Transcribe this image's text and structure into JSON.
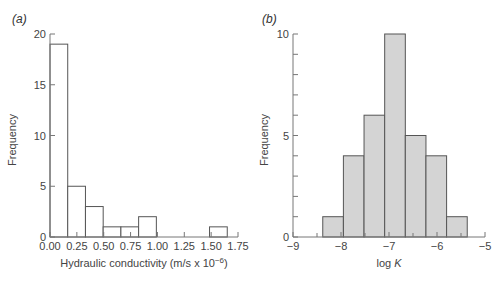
{
  "chart_data": [
    {
      "panel": "(a)",
      "panel_letter": "a",
      "type": "bar",
      "subtype": "histogram",
      "title": "",
      "xlabel": "Hydraulic conductivity (m/s x 10",
      "xlabel_exponent": "−6",
      "xlabel_suffix": ")",
      "ylabel": "Frequency",
      "xlim": [
        0,
        1.75
      ],
      "ylim": [
        0,
        20
      ],
      "x_ticks": [
        0.0,
        0.25,
        0.5,
        0.75,
        1.0,
        1.25,
        1.5,
        1.75
      ],
      "x_tick_labels": [
        "0.00",
        "0.25",
        "0.50",
        "0.75",
        "1.00",
        "1.25",
        "1.50",
        "1.75"
      ],
      "y_ticks": [
        0,
        5,
        10,
        15,
        20
      ],
      "y_tick_labels": [
        "0",
        "5",
        "10",
        "15",
        "20"
      ],
      "bin_edges": [
        0.0,
        0.165,
        0.33,
        0.495,
        0.66,
        0.825,
        0.99,
        1.155,
        1.32,
        1.485,
        1.65
      ],
      "values": [
        19,
        5,
        3,
        1,
        1,
        2,
        0,
        0,
        0,
        1
      ],
      "fill": "#ffffff",
      "stroke": "#555555",
      "grid": false,
      "legend": null
    },
    {
      "panel": "(b)",
      "panel_letter": "b",
      "type": "bar",
      "subtype": "histogram",
      "title": "",
      "xlabel": "log ",
      "xlabel_italic": "K",
      "ylabel": "Frequency",
      "xlim": [
        -9,
        -5
      ],
      "ylim": [
        0,
        10
      ],
      "x_ticks": [
        -9,
        -8,
        -7,
        -6,
        -5
      ],
      "x_tick_labels": [
        "−9",
        "−8",
        "−7",
        "−6",
        "−5"
      ],
      "y_ticks": [
        0,
        5,
        10
      ],
      "y_tick_labels": [
        "0",
        "5",
        "10"
      ],
      "y_minor_ticks": [
        1,
        2,
        3,
        4,
        6,
        7,
        8,
        9
      ],
      "bin_edges": [
        -8.38,
        -7.95,
        -7.52,
        -7.09,
        -6.66,
        -6.23,
        -5.8,
        -5.37
      ],
      "values": [
        1,
        4,
        6,
        10,
        5,
        4,
        1
      ],
      "fill": "#d4d4d4",
      "stroke": "#555555",
      "grid": false,
      "legend": null
    }
  ]
}
